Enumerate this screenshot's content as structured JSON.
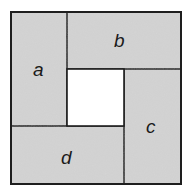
{
  "diagram": {
    "colors": {
      "fill": "#d4d4d4",
      "stroke": "#1e1e1e",
      "center": "#ffffff"
    },
    "rectangles": [
      {
        "label": "a",
        "position": "left-top"
      },
      {
        "label": "b",
        "position": "top-right"
      },
      {
        "label": "c",
        "position": "right-bottom"
      },
      {
        "label": "d",
        "position": "bottom-left"
      }
    ]
  }
}
